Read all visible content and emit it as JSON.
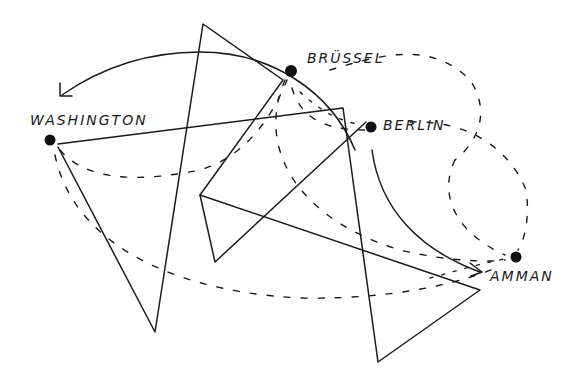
{
  "diagram": {
    "type": "hand-drawn network sketch",
    "nodes": [
      {
        "id": "washington",
        "label": "WASHINGTON",
        "x": 50,
        "y": 140
      },
      {
        "id": "bruessel",
        "label": "BRÜSSEL",
        "x": 291,
        "y": 71
      },
      {
        "id": "berlin",
        "label": "BERLIN",
        "x": 371,
        "y": 127
      },
      {
        "id": "amman",
        "label": "AMMAN",
        "x": 516,
        "y": 257
      }
    ],
    "edges": [
      {
        "from": "bruessel",
        "to": "washington",
        "style": "solid-arrow"
      },
      {
        "from": "bruessel",
        "to": "amman",
        "style": "solid-arrow"
      },
      {
        "from": "washington",
        "to": "amman",
        "style": "dashed"
      },
      {
        "from": "washington",
        "to": "bruessel",
        "style": "dashed"
      },
      {
        "from": "berlin",
        "to": "amman",
        "style": "dashed"
      },
      {
        "from": "bruessel",
        "to": "berlin",
        "style": "dashed"
      }
    ],
    "colors": {
      "ink": "#1a1a1a",
      "background": "#ffffff"
    }
  }
}
